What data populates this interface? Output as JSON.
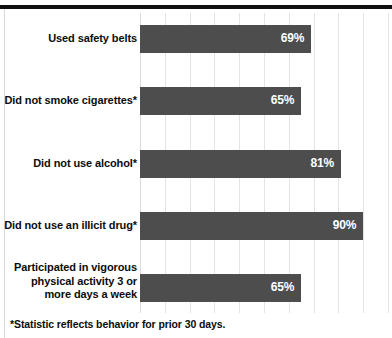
{
  "chart_data": {
    "type": "bar",
    "orientation": "horizontal",
    "title": "",
    "subtitle": "",
    "xlabel": "",
    "ylabel": "",
    "xlim": [
      0,
      100
    ],
    "grid": true,
    "legend": false,
    "value_suffix": "%",
    "bar_color": "#4d4d4d",
    "value_label_color": "#ffffff",
    "gridline_color": "#e3e3e3",
    "gridline_values": [
      0,
      10,
      20,
      30,
      40,
      50,
      60,
      70,
      80,
      90,
      100
    ],
    "categories": [
      "Used safety belts",
      "Did not smoke cigarettes*",
      "Did not use alcohol*",
      "Did not use an illicit drug*",
      "Participated in vigorous physical activity 3 or more days a week"
    ],
    "values": [
      69,
      65,
      81,
      90,
      65
    ],
    "value_labels": [
      "69%",
      "65%",
      "81%",
      "90%",
      "65%"
    ],
    "annotations": [
      "*Statistic reflects behavior for prior 30 days."
    ]
  },
  "rows": [
    {
      "label": "Used safety belts",
      "value_label": "69%",
      "lines": [
        "Used safety belts"
      ]
    },
    {
      "label": "Did not smoke cigarettes*",
      "value_label": "65%",
      "lines": [
        "Did not smoke cigarettes*"
      ]
    },
    {
      "label": "Did not use alcohol*",
      "value_label": "81%",
      "lines": [
        "Did not use alcohol*"
      ]
    },
    {
      "label": "Did not use an illicit drug*",
      "value_label": "90%",
      "lines": [
        "Did not use an illicit drug*"
      ]
    },
    {
      "label": "Participated in vigorous physical activity 3 or more days a week",
      "value_label": "65%",
      "lines": [
        "Participated in vigorous",
        "physical activity 3 or",
        "more days a week"
      ]
    }
  ],
  "footnote": "*Statistic reflects behavior for prior 30 days."
}
